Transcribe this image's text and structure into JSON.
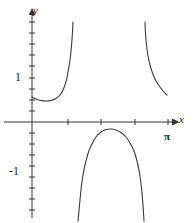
{
  "figure": {
    "background_color": "#ffffff",
    "width": 194,
    "height": 223
  },
  "axes": {
    "x_axis_label": "x",
    "y_axis_label": "y",
    "x_axis_pixel_y": 122,
    "y_axis_pixel_x": 32,
    "origin_label": "",
    "x_tick_labels": [
      "π"
    ],
    "y_tick_labels": [
      "1",
      "-1"
    ],
    "y_one_label": "1",
    "y_negative_one_label": "-1",
    "pi_label": "π",
    "axis_color": "#333333",
    "curve_color": "#3a3a3a"
  },
  "chart_data": {
    "type": "line",
    "title": "",
    "xlabel": "x",
    "ylabel": "y",
    "xlim": [
      -0.25,
      4.2
    ],
    "ylim": [
      -2.0,
      2.6
    ],
    "grid": false,
    "legend": null,
    "x_ticks": [
      0.7853981634,
      1.5707963268,
      2.3561944902,
      3.1415926536
    ],
    "x_tick_labels": [
      "",
      "",
      "",
      "π"
    ],
    "y_ticks": [
      -1,
      1
    ],
    "y_tick_labels": [
      "-1",
      "1"
    ],
    "asymptotes_x": [
      1.2,
      2.0
    ],
    "annotations": [
      {
        "text": "π",
        "x": 3.1415926536,
        "y": -0.34
      },
      {
        "text": "1",
        "x": -0.28,
        "y": 1.0
      },
      {
        "text": "-1",
        "x": -0.38,
        "y": -1.0
      },
      {
        "text": "y",
        "x": 0.04,
        "y": 2.55
      },
      {
        "text": "x",
        "x": 4.15,
        "y": 0.16
      }
    ],
    "series": [
      {
        "name": "branch-left",
        "comment": "Left branch: begins on y-axis just below y=1, shallow minimum, then rises to +infinity at first asymptote",
        "points_px": [
          [
            32,
            97
          ],
          [
            36,
            99
          ],
          [
            41,
            100.5
          ],
          [
            46,
            101
          ],
          [
            51,
            100.5
          ],
          [
            56,
            98.5
          ],
          [
            60,
            95
          ],
          [
            63,
            90
          ],
          [
            66,
            82
          ],
          [
            68,
            72
          ],
          [
            70,
            60
          ],
          [
            71.5,
            46
          ],
          [
            72.5,
            32
          ],
          [
            73,
            22
          ]
        ]
      },
      {
        "name": "branch-right",
        "comment": "Right branch: descends from +infinity at second asymptote, flattening toward the x-axis near pi",
        "points_px": [
          [
            145,
            22
          ],
          [
            145.5,
            33
          ],
          [
            146.5,
            45
          ],
          [
            148,
            56
          ],
          [
            150,
            65
          ],
          [
            152.5,
            73
          ],
          [
            155.5,
            80
          ],
          [
            158.5,
            85
          ],
          [
            161.5,
            89
          ],
          [
            164,
            92
          ],
          [
            166,
            94
          ],
          [
            167,
            95
          ]
        ]
      },
      {
        "name": "branch-middle-negative",
        "comment": "Middle branch below the x-axis: rises from -infinity, peaks near y = -0.2, returns to -infinity",
        "points_px": [
          [
            78,
            221
          ],
          [
            79.5,
            205
          ],
          [
            81,
            190
          ],
          [
            83,
            175
          ],
          [
            85.5,
            163
          ],
          [
            88.5,
            152
          ],
          [
            92,
            144
          ],
          [
            96,
            137
          ],
          [
            101,
            132
          ],
          [
            106,
            129.5
          ],
          [
            111,
            129
          ],
          [
            116,
            130
          ],
          [
            121,
            132.5
          ],
          [
            126,
            137
          ],
          [
            130,
            143
          ],
          [
            134,
            151
          ],
          [
            137,
            161
          ],
          [
            139.5,
            173
          ],
          [
            141.5,
            188
          ],
          [
            143,
            205
          ],
          [
            144,
            221
          ]
        ]
      }
    ]
  },
  "ticks": {
    "y_axis_tick_pixels": [
      22,
      33,
      44,
      55,
      66,
      78,
      89,
      100,
      111,
      133,
      144,
      155,
      166,
      177,
      188,
      199,
      210
    ],
    "x_axis_tick_pixels": [
      68,
      101,
      135,
      168
    ],
    "tick_half_length": 3
  }
}
